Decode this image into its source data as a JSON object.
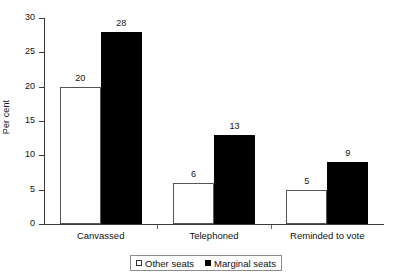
{
  "chart_data": {
    "type": "bar",
    "title": "",
    "xlabel": "",
    "ylabel": "Per cent",
    "ylim": [
      0,
      30
    ],
    "yticks": [
      0,
      5,
      10,
      15,
      20,
      25,
      30
    ],
    "ytick_labels": [
      "0",
      "5",
      "10",
      "15",
      "20",
      "25",
      "30"
    ],
    "grid": false,
    "legend_position": "bottom",
    "categories": [
      "Canvassed",
      "Telephoned",
      "Reminded to vote"
    ],
    "series": [
      {
        "name": "Other seats",
        "style": "open",
        "color": "#ffffff",
        "edge_color": "#555555",
        "values": [
          20,
          6,
          5
        ],
        "labels": [
          "20",
          "6",
          "5"
        ]
      },
      {
        "name": "Marginal seats",
        "style": "filled",
        "color": "#000000",
        "edge_color": "#000000",
        "values": [
          28,
          13,
          9
        ],
        "labels": [
          "28",
          "13",
          "9"
        ]
      }
    ]
  },
  "legend": {
    "entries": [
      {
        "label": "Other seats",
        "marker": "open-square-marker"
      },
      {
        "label": "Marginal seats",
        "marker": "filled-square-marker"
      }
    ]
  }
}
